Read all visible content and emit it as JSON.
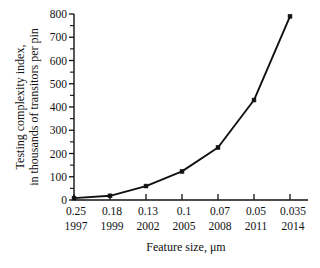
{
  "chart_data": {
    "type": "line",
    "title": "",
    "xlabel": "Feature size, μm",
    "ylabel": "Testing complexity index, in thousands of transitors per pin",
    "ylabel_line1": "Testing complexity index,",
    "ylabel_line2": "in thousands of transitors per pin",
    "categories": [
      "0.25",
      "0.18",
      "0.13",
      "0.1",
      "0.07",
      "0.05",
      "0.035"
    ],
    "secondary_categories": [
      "1997",
      "1999",
      "2002",
      "2005",
      "2008",
      "2011",
      "2014"
    ],
    "values": [
      8,
      18,
      60,
      123,
      226,
      430,
      790
    ],
    "series": [
      {
        "name": "Testing complexity index",
        "values": [
          8,
          18,
          60,
          123,
          226,
          430,
          790
        ]
      }
    ],
    "ylim": [
      0,
      800
    ],
    "ytick_labels": [
      "0",
      "100",
      "200",
      "300",
      "400",
      "500",
      "600",
      "700",
      "800"
    ],
    "ytick_values": [
      0,
      100,
      200,
      300,
      400,
      500,
      600,
      700,
      800
    ],
    "yminor_step": 50,
    "grid": false,
    "legend": "none",
    "marker": "square",
    "line_color": "#111111",
    "marker_color": "#111111",
    "background_color": "#ffffff"
  },
  "axes": {
    "x_axis_name": "feature-size-axis",
    "y_axis_name": "testing-complexity-axis"
  }
}
